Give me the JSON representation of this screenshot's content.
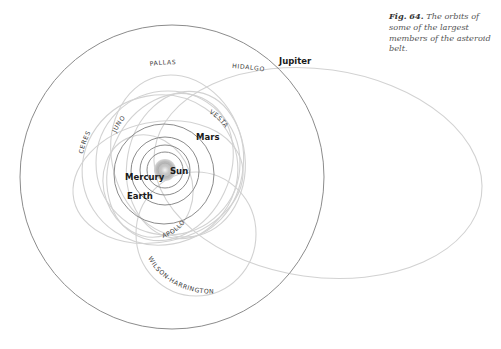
{
  "caption": {
    "figure_number": "Fig. 64.",
    "text": " The orbits of some of the largest members of the asteroid belt."
  },
  "planets": {
    "sun": "Sun",
    "mercury": "Mercury",
    "earth": "Earth",
    "mars": "Mars",
    "jupiter": "Jupiter"
  },
  "asteroids": {
    "pallas": "PALLAS",
    "hidalgo": "HIDALGO",
    "juno": "JUNO",
    "vesta": "VESTA",
    "ceres": "CERES",
    "apollo": "APOLLO",
    "wilson_harrington": "WILSON-HARRINGTON"
  },
  "colors": {
    "planet_orbit": "#8c8c8c",
    "asteroid_orbit": "#d2d2d2",
    "sun": "#b5b5b5"
  }
}
